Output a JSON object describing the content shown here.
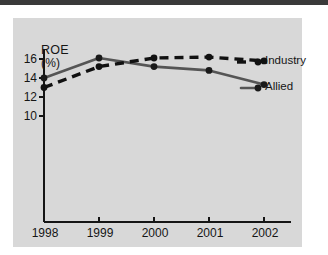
{
  "chart_data": {
    "type": "line",
    "title": "ROE",
    "subtitle": "(%)",
    "ylabel": "ROE (%)",
    "xlabel": "",
    "x": [
      1998,
      1999,
      2000,
      2001,
      2002
    ],
    "categories": [
      "1998",
      "1999",
      "2000",
      "2001",
      "2002"
    ],
    "xticklabels": [
      "1998",
      "1999",
      "2000",
      "2001",
      "2002"
    ],
    "yticklabels": [
      "16",
      "14",
      "12",
      "10"
    ],
    "yticks": [
      16,
      14,
      12,
      10
    ],
    "ylim": [
      8.4,
      17.1
    ],
    "xlim": [
      1997.75,
      2002.6
    ],
    "grid": false,
    "legend_position": "right",
    "series": [
      {
        "name": "Industry",
        "style": "dashed",
        "color": "#111111",
        "marker": "circle",
        "values": [
          13.0,
          15.2,
          16.1,
          16.2,
          15.8
        ]
      },
      {
        "name": "Allied",
        "style": "solid",
        "color": "#555555",
        "marker": "circle",
        "values": [
          14.0,
          16.1,
          15.2,
          14.8,
          13.3
        ]
      }
    ]
  },
  "legend": {
    "industry_label": "Industry",
    "allied_label": "Allied"
  },
  "colors": {
    "plate": "#d8d8d8",
    "axis": "#151515",
    "industry": "#111111",
    "allied": "#555555",
    "page": "#ffffff"
  }
}
